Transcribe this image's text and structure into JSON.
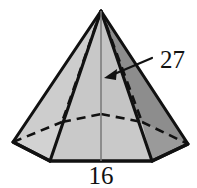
{
  "figure": {
    "shape_name": "hexagonal-pyramid",
    "background_color": "#ffffff",
    "outline_color": "#111111",
    "labels": {
      "height_label": "27",
      "base_edge_label": "16"
    },
    "colors": {
      "face_light": "#cfcfcf",
      "face_mid": "#c2c2c2",
      "face_base_front": "#c9c9c9",
      "face_dark": "#8f8f8f",
      "face_darker": "#7d7d7d",
      "outline": "#111111",
      "axis_line": "#6e6e6e",
      "dashed": "#111111",
      "arrow": "#111111",
      "text": "#111111"
    },
    "geometry": {
      "apex": [
        101,
        11
      ],
      "base_vertices_front": [
        [
          13,
          142
        ],
        [
          50,
          161
        ],
        [
          152,
          161
        ],
        [
          188,
          144
        ]
      ],
      "base_vertices_back_hidden": [
        [
          62,
          122
        ],
        [
          101,
          114
        ],
        [
          142,
          122
        ]
      ],
      "base_center": [
        101,
        137
      ]
    },
    "annotations": {
      "height_arrow_from": [
        150,
        60
      ],
      "height_arrow_to": [
        107,
        77
      ],
      "height_label_position": [
        158,
        68
      ],
      "base_label_position": [
        101,
        182
      ]
    }
  }
}
